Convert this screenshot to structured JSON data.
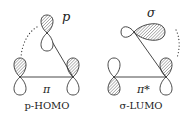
{
  "diagrams": [
    {
      "id": "p-homo",
      "orbital_label": "p",
      "bond_label": "π",
      "caption": "p-HOMO"
    },
    {
      "id": "sigma-lumo",
      "orbital_label": "σ",
      "bond_label": "π*",
      "caption": "σ-LUMO"
    }
  ],
  "colors": {
    "line": "#333333",
    "hatch": "#555555",
    "background": "#ffffff"
  }
}
